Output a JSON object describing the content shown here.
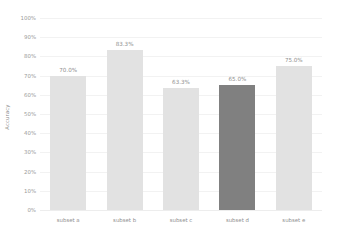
{
  "chart_data": {
    "type": "bar",
    "title": "",
    "xlabel": "",
    "ylabel": "Accuracy",
    "categories": [
      "subset a",
      "subset b",
      "subset c",
      "subset d",
      "subset e"
    ],
    "values": [
      70.0,
      83.3,
      63.3,
      65.0,
      75.0
    ],
    "value_labels": [
      "70.0%",
      "83.3%",
      "63.3%",
      "65.0%",
      "75.0%"
    ],
    "ylim": [
      0,
      100
    ],
    "yticks": [
      0,
      10,
      20,
      30,
      40,
      50,
      60,
      70,
      80,
      90,
      100
    ],
    "ytick_labels": [
      "0%",
      "10%",
      "20%",
      "30%",
      "40%",
      "50%",
      "60%",
      "70%",
      "80%",
      "90%",
      "100%"
    ],
    "grid": true,
    "legend": "none",
    "highlighted_category": "subset d",
    "colors": {
      "bar": "#e2e2e2",
      "bar_highlight": "#808080",
      "gridline": "#f2f2f2",
      "tick_text": "#9a9a9a",
      "value_text": "#909090",
      "axis_title": "#8a8a8a",
      "background": "#ffffff"
    }
  }
}
